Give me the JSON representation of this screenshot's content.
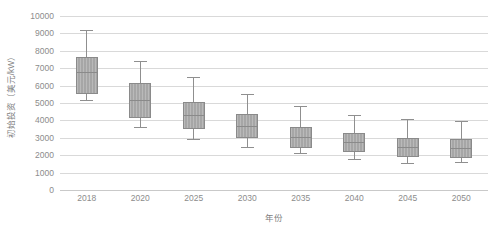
{
  "chart_data": {
    "type": "box",
    "title": "",
    "xlabel": "年份",
    "ylabel": "初始投资（美元/kW）",
    "ylim": [
      0,
      10000
    ],
    "ytick_step": 1000,
    "yticks": [
      "10000",
      "9000",
      "8000",
      "7000",
      "6000",
      "5000",
      "4000",
      "3000",
      "2000",
      "1000",
      "0"
    ],
    "ytick_values": [
      10000,
      9000,
      8000,
      7000,
      6000,
      5000,
      4000,
      3000,
      2000,
      1000,
      0
    ],
    "categories": [
      "2018",
      "2020",
      "2025",
      "2030",
      "2035",
      "2040",
      "2045",
      "2050"
    ],
    "grid": true,
    "legend": "none",
    "box_fill_color": "#a6a6a6",
    "box_border_color": "#8a8a8a",
    "whisker_color": "#8f8f8f",
    "gridline_color": "#d9d9d9",
    "axis_text_color": "#8c8c8c",
    "boxes": [
      {
        "category": "2018",
        "whisker_low": 5170,
        "q1": 5490,
        "median": 6800,
        "q3": 7650,
        "whisker_high": 9200
      },
      {
        "category": "2020",
        "whisker_low": 3600,
        "q1": 4120,
        "median": 5150,
        "q3": 6130,
        "whisker_high": 7400
      },
      {
        "category": "2025",
        "whisker_low": 2930,
        "q1": 3490,
        "median": 4300,
        "q3": 5075,
        "whisker_high": 6510
      },
      {
        "category": "2030",
        "whisker_low": 2490,
        "q1": 2970,
        "median": 3700,
        "q3": 4350,
        "whisker_high": 5500
      },
      {
        "category": "2035",
        "whisker_low": 2110,
        "q1": 2430,
        "median": 3050,
        "q3": 3600,
        "whisker_high": 4830
      },
      {
        "category": "2040",
        "whisker_low": 1760,
        "q1": 2200,
        "median": 2750,
        "q3": 3260,
        "whisker_high": 4290
      },
      {
        "category": "2045",
        "whisker_low": 1535,
        "q1": 1915,
        "median": 2450,
        "q3": 2970,
        "whisker_high": 4080
      },
      {
        "category": "2050",
        "whisker_low": 1590,
        "q1": 1860,
        "median": 2400,
        "q3": 2915,
        "whisker_high": 3965
      }
    ]
  }
}
